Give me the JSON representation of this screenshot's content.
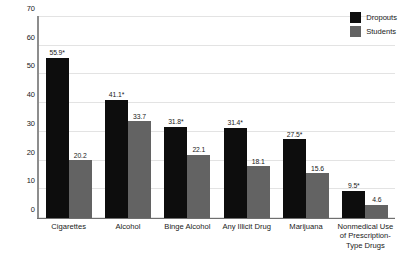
{
  "chart_data": {
    "type": "bar",
    "title": "",
    "subtitle": "",
    "xlabel": "",
    "ylabel": "Percent",
    "ylim": [
      0,
      70
    ],
    "yticks": [
      0,
      10,
      20,
      30,
      40,
      50,
      60,
      70
    ],
    "ytick_labels": [
      "0",
      "10",
      "20",
      "30",
      "40",
      "50",
      "60",
      "70"
    ],
    "grid": true,
    "grid_axis": "y",
    "legend_position": "top-right",
    "categories": [
      "Cigarettes",
      "Alcohol",
      "Binge Alcohol",
      "Any Illicit Drug",
      "Marijuana",
      "Nonmedical Use\nof Prescription-\nType Drugs"
    ],
    "series": [
      {
        "name": "Dropouts",
        "color": "#0d0d0d",
        "values": [
          55.9,
          41.1,
          31.8,
          31.4,
          27.5,
          9.5
        ],
        "labels": [
          "55.9*",
          "41.1*",
          "31.8*",
          "31.4*",
          "27.5*",
          "9.5*"
        ]
      },
      {
        "name": "Students",
        "color": "#636363",
        "values": [
          20.2,
          33.7,
          22.1,
          18.1,
          15.6,
          4.6
        ],
        "labels": [
          "20.2",
          "33.7",
          "22.1",
          "18.1",
          "15.6",
          "4.6"
        ]
      }
    ],
    "annotations": [
      "* denotes statistically significant difference"
    ]
  },
  "legend": {
    "items": [
      {
        "label": "Dropouts",
        "color": "#0d0d0d"
      },
      {
        "label": "Students",
        "color": "#636363"
      }
    ]
  },
  "axis": {
    "y_title": "Percent"
  }
}
